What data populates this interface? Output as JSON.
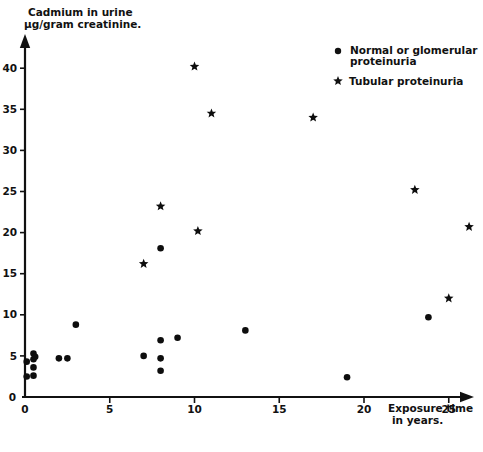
{
  "figure": {
    "background_color": "#ffffff",
    "ink_color": "#111111"
  },
  "axes": {
    "y_title_line1": "Cadmium in urine",
    "y_title_line2": "µg/gram creatinine.",
    "x_title_line1": "Exposure time",
    "x_title_line2": "in years.",
    "y_ticks": [
      "40",
      "35",
      "30",
      "25",
      "20",
      "15",
      "10",
      "5",
      "0"
    ],
    "x_ticks": [
      "0",
      "5",
      "10",
      "15",
      "20",
      "25"
    ]
  },
  "legend": {
    "items": [
      {
        "marker": "dot-marker",
        "label_line1": "Normal or glomerular",
        "label_line2": "proteinuria"
      },
      {
        "marker": "star-marker",
        "label_line1": "Tubular proteinuria",
        "label_line2": ""
      }
    ]
  },
  "chart_data": {
    "type": "scatter",
    "title": "",
    "xlabel": "Exposure time in years.",
    "ylabel": "Cadmium in urine µg/gram creatinine.",
    "xlim": [
      0,
      27.5
    ],
    "ylim": [
      0,
      42
    ],
    "xticks": [
      0,
      5,
      10,
      15,
      20,
      25
    ],
    "yticks": [
      0,
      5,
      10,
      15,
      20,
      25,
      30,
      35,
      40
    ],
    "grid": false,
    "legend_position": "top-right",
    "series": [
      {
        "name": "Normal or glomerular proteinuria",
        "marker": "circle",
        "color": "#0d0d0d",
        "points": [
          [
            0.1,
            4.3
          ],
          [
            0.1,
            2.5
          ],
          [
            0.5,
            5.3
          ],
          [
            0.5,
            4.6
          ],
          [
            0.5,
            3.6
          ],
          [
            0.5,
            2.6
          ],
          [
            0.6,
            4.9
          ],
          [
            2.0,
            4.7
          ],
          [
            2.5,
            4.7
          ],
          [
            3.0,
            8.8
          ],
          [
            7.0,
            5.0
          ],
          [
            8.0,
            18.1
          ],
          [
            8.0,
            6.9
          ],
          [
            8.0,
            4.7
          ],
          [
            8.0,
            3.2
          ],
          [
            9.0,
            7.2
          ],
          [
            13.0,
            8.1
          ],
          [
            19.0,
            2.4
          ],
          [
            23.8,
            9.7
          ]
        ]
      },
      {
        "name": "Tubular proteinuria",
        "marker": "star",
        "color": "#0d0d0d",
        "points": [
          [
            7.0,
            16.2
          ],
          [
            8.0,
            23.2
          ],
          [
            10.0,
            40.2
          ],
          [
            10.2,
            20.2
          ],
          [
            11.0,
            34.5
          ],
          [
            17.0,
            34.0
          ],
          [
            23.0,
            25.2
          ],
          [
            25.0,
            12.0
          ],
          [
            26.2,
            20.7
          ]
        ]
      }
    ]
  }
}
